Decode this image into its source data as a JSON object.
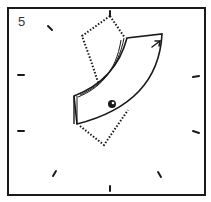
{
  "figure": {
    "step_number": "5",
    "colors": {
      "line": "#1a1a1a",
      "background": "#ffffff"
    },
    "ticks": [
      {
        "id": "top",
        "x1": 110,
        "y1": 11,
        "x2": 110,
        "y2": 16
      },
      {
        "id": "upper-left",
        "x1": 48,
        "y1": 26,
        "x2": 52,
        "y2": 30
      },
      {
        "id": "left-upper",
        "x1": 18,
        "y1": 75,
        "x2": 24,
        "y2": 75
      },
      {
        "id": "left-lower",
        "x1": 18,
        "y1": 131,
        "x2": 24,
        "y2": 131
      },
      {
        "id": "right-upper",
        "x1": 193,
        "y1": 77,
        "x2": 199,
        "y2": 76
      },
      {
        "id": "right-lower",
        "x1": 193,
        "y1": 131,
        "x2": 199,
        "y2": 133
      },
      {
        "id": "bottom-left",
        "x1": 53,
        "y1": 176,
        "x2": 56,
        "y2": 171
      },
      {
        "id": "bottom",
        "x1": 110,
        "y1": 186,
        "x2": 110,
        "y2": 191
      },
      {
        "id": "bottom-right",
        "x1": 158,
        "y1": 172,
        "x2": 161,
        "y2": 177
      }
    ]
  }
}
